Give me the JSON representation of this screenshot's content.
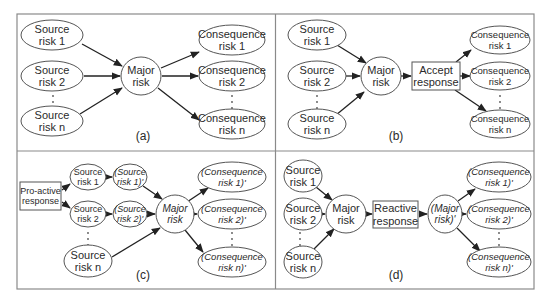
{
  "figure": {
    "frame": {
      "x": 17,
      "y": 14,
      "w": 517,
      "h": 275,
      "divider_x": 275.5,
      "divider_y": 151
    },
    "panels": [
      {
        "id": "a",
        "caption": "(a)",
        "caption_pos": [
          143,
          140
        ],
        "nodes": [
          {
            "id": "s1",
            "shape": "ellipse",
            "cx": 52,
            "cy": 35,
            "rx": 31,
            "ry": 15,
            "lines": [
              "Source",
              "risk 1"
            ],
            "fs": 11
          },
          {
            "id": "s2",
            "shape": "ellipse",
            "cx": 52,
            "cy": 76,
            "rx": 31,
            "ry": 15,
            "lines": [
              "Source",
              "risk 2"
            ],
            "fs": 11
          },
          {
            "id": "sn",
            "shape": "ellipse",
            "cx": 52,
            "cy": 121,
            "rx": 31,
            "ry": 15,
            "lines": [
              "Source",
              "risk n"
            ],
            "fs": 11
          },
          {
            "id": "m",
            "shape": "ellipse",
            "cx": 141,
            "cy": 76,
            "rx": 20,
            "ry": 19,
            "lines": [
              "Major",
              "risk"
            ],
            "fs": 11
          },
          {
            "id": "c1",
            "shape": "ellipse",
            "cx": 232,
            "cy": 40,
            "rx": 33,
            "ry": 15,
            "lines": [
              "Consequence",
              "risk 1"
            ],
            "fs": 11
          },
          {
            "id": "c2",
            "shape": "ellipse",
            "cx": 232,
            "cy": 76,
            "rx": 33,
            "ry": 15,
            "lines": [
              "Consequence",
              "risk 2"
            ],
            "fs": 11
          },
          {
            "id": "cn",
            "shape": "ellipse",
            "cx": 232,
            "cy": 124,
            "rx": 33,
            "ry": 15,
            "lines": [
              "Consequence",
              "risk n"
            ],
            "fs": 11
          }
        ],
        "edges": [
          [
            82,
            44,
            122,
            66
          ],
          [
            84,
            76,
            120,
            76
          ],
          [
            80,
            114,
            122,
            88
          ],
          [
            161,
            68,
            199,
            52
          ],
          [
            162,
            76,
            198,
            76
          ],
          [
            158,
            88,
            199,
            120
          ]
        ],
        "dots": [
          [
            53,
            96
          ],
          [
            53,
            102
          ],
          [
            53,
            108
          ],
          [
            232,
            96
          ],
          [
            232,
            102
          ],
          [
            232,
            108
          ]
        ]
      },
      {
        "id": "b",
        "caption": "(b)",
        "caption_pos": [
          396,
          140
        ],
        "nodes": [
          {
            "id": "s1",
            "shape": "ellipse",
            "cx": 317,
            "cy": 35,
            "rx": 29,
            "ry": 15,
            "lines": [
              "Source",
              "risk 1"
            ],
            "fs": 11
          },
          {
            "id": "s2",
            "shape": "ellipse",
            "cx": 317,
            "cy": 76,
            "rx": 29,
            "ry": 15,
            "lines": [
              "Source",
              "risk 2"
            ],
            "fs": 11
          },
          {
            "id": "sn",
            "shape": "ellipse",
            "cx": 317,
            "cy": 124,
            "rx": 29,
            "ry": 15,
            "lines": [
              "Source",
              "risk n"
            ],
            "fs": 11
          },
          {
            "id": "m",
            "shape": "ellipse",
            "cx": 381,
            "cy": 76,
            "rx": 20,
            "ry": 19,
            "lines": [
              "Major",
              "risk"
            ],
            "fs": 11
          },
          {
            "id": "resp",
            "shape": "rect",
            "x": 412,
            "y": 62,
            "w": 48,
            "h": 28,
            "lines": [
              "Accept",
              "response"
            ],
            "fs": 11
          },
          {
            "id": "c1",
            "shape": "ellipse",
            "cx": 500,
            "cy": 40,
            "rx": 30,
            "ry": 14,
            "lines": [
              "Consequence",
              "risk 1"
            ],
            "fs": 9.5
          },
          {
            "id": "c2",
            "shape": "ellipse",
            "cx": 500,
            "cy": 76,
            "rx": 30,
            "ry": 14,
            "lines": [
              "Consequence",
              "risk 2"
            ],
            "fs": 9.5
          },
          {
            "id": "cn",
            "shape": "ellipse",
            "cx": 500,
            "cy": 124,
            "rx": 30,
            "ry": 14,
            "lines": [
              "Consequence",
              "risk n"
            ],
            "fs": 9.5
          }
        ],
        "edges": [
          [
            337,
            45,
            366,
            63
          ],
          [
            346,
            76,
            360,
            76
          ],
          [
            336,
            115,
            364,
            92
          ],
          [
            401,
            76,
            411,
            76
          ],
          [
            456,
            62,
            471,
            50
          ],
          [
            460,
            76,
            470,
            76
          ],
          [
            455,
            90,
            486,
            111
          ]
        ],
        "dots": [
          [
            317,
            96
          ],
          [
            317,
            102
          ],
          [
            317,
            108
          ],
          [
            500,
            96
          ],
          [
            500,
            102
          ],
          [
            500,
            108
          ]
        ]
      },
      {
        "id": "c",
        "caption": "(c)",
        "caption_pos": [
          143,
          279
        ],
        "nodes": [
          {
            "id": "pro",
            "shape": "rect",
            "x": 20,
            "y": 182,
            "w": 41,
            "h": 28,
            "lines": [
              "Pro-active",
              "response"
            ],
            "fs": 9
          },
          {
            "id": "s1",
            "shape": "ellipse",
            "cx": 88,
            "cy": 177,
            "rx": 18,
            "ry": 13,
            "lines": [
              "Source",
              "risk 1"
            ],
            "fs": 9,
            "italic": false
          },
          {
            "id": "s1p",
            "shape": "ellipse",
            "cx": 130,
            "cy": 177,
            "rx": 17,
            "ry": 13,
            "lines": [
              "(Source",
              "risk 1)'"
            ],
            "fs": 9,
            "italic": true
          },
          {
            "id": "s2",
            "shape": "ellipse",
            "cx": 88,
            "cy": 214,
            "rx": 18,
            "ry": 13,
            "lines": [
              "Source",
              "risk 2"
            ],
            "fs": 9,
            "italic": false
          },
          {
            "id": "s2p",
            "shape": "ellipse",
            "cx": 130,
            "cy": 214,
            "rx": 17,
            "ry": 13,
            "lines": [
              "(Source",
              "risk 2)'"
            ],
            "fs": 9,
            "italic": true
          },
          {
            "id": "sn",
            "shape": "ellipse",
            "cx": 88,
            "cy": 261,
            "rx": 24,
            "ry": 16,
            "lines": [
              "Source",
              "risk n"
            ],
            "fs": 11
          },
          {
            "id": "m",
            "shape": "ellipse",
            "cx": 175,
            "cy": 214,
            "rx": 19,
            "ry": 19,
            "lines": [
              "Major",
              "risk"
            ],
            "fs": 10,
            "italic": true
          },
          {
            "id": "c1",
            "shape": "ellipse",
            "cx": 232,
            "cy": 177,
            "rx": 34,
            "ry": 15,
            "lines": [
              "(Consequence",
              "risk 1)'"
            ],
            "fs": 9.5,
            "italic": true
          },
          {
            "id": "c2",
            "shape": "ellipse",
            "cx": 232,
            "cy": 214,
            "rx": 34,
            "ry": 15,
            "lines": [
              "(Consequence",
              "risk 2)'"
            ],
            "fs": 9.5,
            "italic": true
          },
          {
            "id": "cn",
            "shape": "ellipse",
            "cx": 232,
            "cy": 262,
            "rx": 34,
            "ry": 15,
            "lines": [
              "(Consequence",
              "risk n)'"
            ],
            "fs": 9.5,
            "italic": true
          }
        ],
        "edges": [
          [
            62,
            190,
            70,
            184
          ],
          [
            62,
            202,
            70,
            208
          ],
          [
            106,
            177,
            112,
            177
          ],
          [
            106,
            214,
            112,
            214
          ],
          [
            143,
            186,
            162,
            199
          ],
          [
            147,
            214,
            155,
            214
          ],
          [
            112,
            257,
            160,
            228
          ],
          [
            187,
            202,
            208,
            188
          ],
          [
            194,
            214,
            197,
            214
          ],
          [
            185,
            230,
            203,
            252
          ]
        ],
        "dots": [
          [
            88,
            233
          ],
          [
            88,
            239
          ],
          [
            88,
            245
          ],
          [
            232,
            233
          ],
          [
            232,
            239
          ],
          [
            232,
            245
          ]
        ]
      },
      {
        "id": "d",
        "caption": "(d)",
        "caption_pos": [
          396,
          279
        ],
        "nodes": [
          {
            "id": "s1",
            "shape": "ellipse",
            "cx": 303,
            "cy": 176,
            "rx": 19,
            "ry": 16,
            "lines": [
              "Source",
              "risk 1"
            ],
            "fs": 11
          },
          {
            "id": "s2",
            "shape": "ellipse",
            "cx": 303,
            "cy": 214,
            "rx": 19,
            "ry": 16,
            "lines": [
              "Source",
              "risk 2"
            ],
            "fs": 11
          },
          {
            "id": "sn",
            "shape": "ellipse",
            "cx": 303,
            "cy": 262,
            "rx": 19,
            "ry": 16,
            "lines": [
              "Source",
              "risk n"
            ],
            "fs": 11
          },
          {
            "id": "m",
            "shape": "ellipse",
            "cx": 346,
            "cy": 214,
            "rx": 20,
            "ry": 19,
            "lines": [
              "Major",
              "risk"
            ],
            "fs": 11
          },
          {
            "id": "resp",
            "shape": "rect",
            "x": 373,
            "y": 201,
            "w": 45,
            "h": 27,
            "lines": [
              "Reactive",
              "response"
            ],
            "fs": 11
          },
          {
            "id": "mp",
            "shape": "ellipse",
            "cx": 445,
            "cy": 214,
            "rx": 17,
            "ry": 19,
            "lines": [
              "(Major",
              "risk)'"
            ],
            "fs": 10,
            "italic": true
          },
          {
            "id": "c1",
            "shape": "ellipse",
            "cx": 499,
            "cy": 177,
            "rx": 32,
            "ry": 15,
            "lines": [
              "(Consequence",
              "risk 1)'"
            ],
            "fs": 9.5,
            "italic": true
          },
          {
            "id": "c2",
            "shape": "ellipse",
            "cx": 499,
            "cy": 214,
            "rx": 32,
            "ry": 15,
            "lines": [
              "(Consequence",
              "risk 2)'"
            ],
            "fs": 9.5,
            "italic": true
          },
          {
            "id": "cn",
            "shape": "ellipse",
            "cx": 499,
            "cy": 262,
            "rx": 32,
            "ry": 15,
            "lines": [
              "(Consequence",
              "risk n)'"
            ],
            "fs": 9.5,
            "italic": true
          }
        ],
        "edges": [
          [
            316,
            187,
            332,
            200
          ],
          [
            322,
            214,
            325,
            214
          ],
          [
            314,
            249,
            334,
            229
          ],
          [
            366,
            214,
            372,
            214
          ],
          [
            419,
            214,
            427,
            214
          ],
          [
            458,
            201,
            475,
            189
          ],
          [
            462,
            214,
            466,
            214
          ],
          [
            457,
            228,
            480,
            251
          ]
        ],
        "dots": [
          [
            300,
            233
          ],
          [
            300,
            239
          ],
          [
            300,
            245
          ],
          [
            499,
            233
          ],
          [
            499,
            239
          ],
          [
            499,
            245
          ]
        ]
      }
    ]
  }
}
